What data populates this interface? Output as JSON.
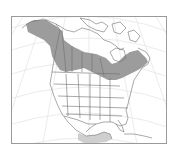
{
  "map": {
    "type": "range-map",
    "region": "North America",
    "colors": {
      "background": "#ffffff",
      "frame": "#9a9a9a",
      "graticule": "#dcdcdc",
      "borders": "#6e6e6e",
      "range_primary": "#9c9c9c",
      "range_secondary": "#cfcfcf"
    },
    "layers": [
      {
        "name": "breeding-range",
        "shade": "dark",
        "area": "Alaska, boreal Canada to Labrador"
      },
      {
        "name": "winter-range",
        "shade": "light",
        "area": "southern Mexico"
      }
    ]
  }
}
